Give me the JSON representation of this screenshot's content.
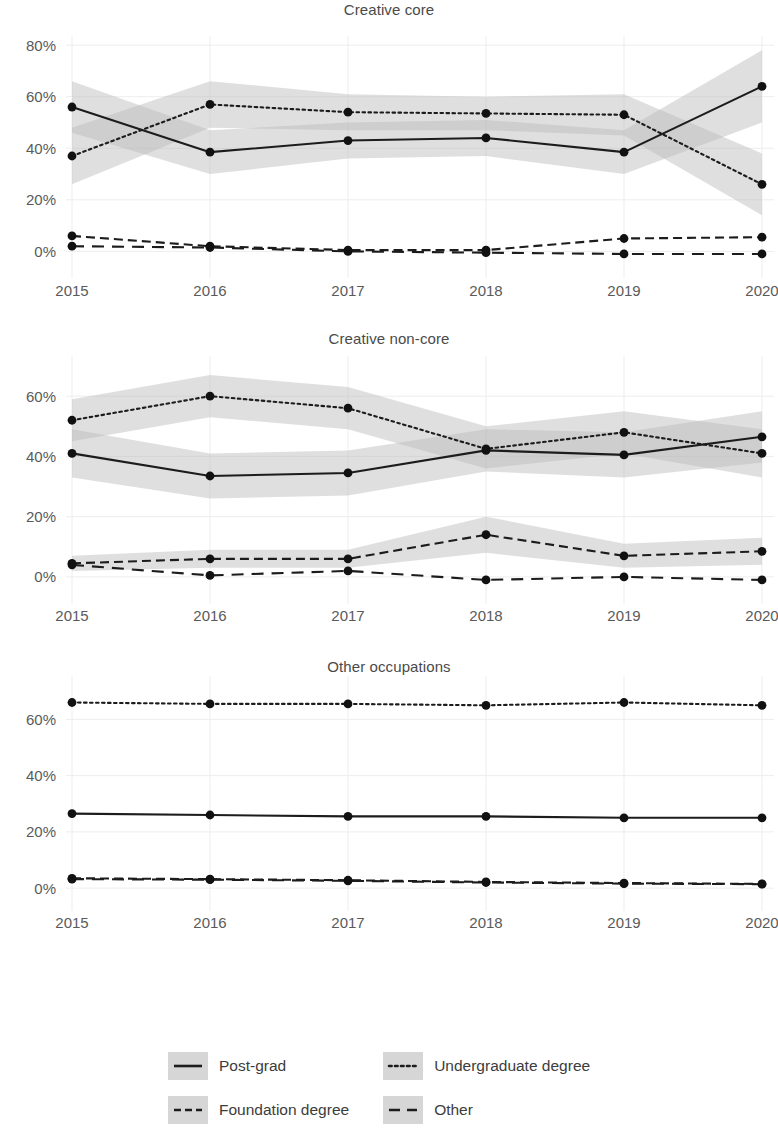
{
  "chart_data": {
    "type": "line",
    "title": "",
    "xlabel": "",
    "ylabel": "",
    "x": [
      2015,
      2016,
      2017,
      2018,
      2019,
      2020
    ],
    "xtick_labels": [
      "2015",
      "2016",
      "2017",
      "2018",
      "2019",
      "2020"
    ],
    "legend_position": "bottom",
    "grid": true,
    "value_format": "percent",
    "ribbon_description": "shaded 95% confidence interval band around each series",
    "panels": [
      {
        "title": "Creative core",
        "ylim": [
          -8,
          82
        ],
        "ytick_labels": [
          "0%",
          "20%",
          "40%",
          "60%",
          "80%"
        ],
        "yticks": [
          0,
          20,
          40,
          60,
          80
        ],
        "series": [
          {
            "name": "Post-grad",
            "style": "solid",
            "values": [
              56,
              38.5,
              43,
              44,
              38.5,
              64
            ],
            "lower": [
              46,
              30,
              36,
              37,
              30,
              50
            ],
            "upper": [
              66,
              47,
              50,
              51,
              47,
              78
            ]
          },
          {
            "name": "Undergraduate degree",
            "style": "dotted",
            "values": [
              37,
              57,
              54,
              53.5,
              53,
              26
            ],
            "lower": [
              26,
              48,
              47,
              47,
              45,
              14
            ],
            "upper": [
              48,
              66,
              61,
              60,
              61,
              38
            ]
          },
          {
            "name": "Foundation degree",
            "style": "dashdot",
            "values": [
              6,
              2,
              0.5,
              0.5,
              5,
              5.5
            ],
            "lower": [
              6,
              2,
              0.5,
              0.5,
              5,
              5.5
            ],
            "upper": [
              6,
              2,
              0.5,
              0.5,
              5,
              5.5
            ]
          },
          {
            "name": "Other",
            "style": "dashed",
            "values": [
              2,
              1.5,
              0,
              -0.5,
              -1,
              -1
            ],
            "lower": [
              2,
              1.5,
              0,
              -0.5,
              -1,
              -1
            ],
            "upper": [
              2,
              1.5,
              0,
              -0.5,
              -1,
              -1
            ]
          }
        ]
      },
      {
        "title": "Creative non-core",
        "ylim": [
          -7,
          72
        ],
        "ytick_labels": [
          "0%",
          "20%",
          "40%",
          "60%"
        ],
        "yticks": [
          0,
          20,
          40,
          60
        ],
        "series": [
          {
            "name": "Post-grad",
            "style": "solid",
            "values": [
              41,
              33.5,
              34.5,
              42,
              40.5,
              46.5
            ],
            "lower": [
              33,
              26,
              27,
              35,
              33,
              38
            ],
            "upper": [
              49,
              41,
              42,
              49,
              48,
              55
            ]
          },
          {
            "name": "Undergraduate degree",
            "style": "dotted",
            "values": [
              52,
              60,
              56,
              42.5,
              48,
              41
            ],
            "lower": [
              45,
              53,
              49,
              36,
              41,
              33
            ],
            "upper": [
              59,
              67,
              63,
              50,
              55,
              49
            ]
          },
          {
            "name": "Foundation degree",
            "style": "dashdot",
            "values": [
              4.5,
              6,
              6,
              14,
              7,
              8.5
            ],
            "lower": [
              2,
              3,
              3,
              8,
              3,
              4
            ],
            "upper": [
              7,
              9,
              9,
              20,
              11,
              13
            ]
          },
          {
            "name": "Other",
            "style": "dashed",
            "values": [
              4,
              0.5,
              2,
              -1,
              0,
              -1
            ],
            "lower": [
              4,
              0.5,
              2,
              -1,
              0,
              -1
            ],
            "upper": [
              4,
              0.5,
              2,
              -1,
              0,
              -1
            ]
          }
        ]
      },
      {
        "title": "Other occupations",
        "ylim": [
          -6,
          74
        ],
        "ytick_labels": [
          "0%",
          "20%",
          "40%",
          "60%"
        ],
        "yticks": [
          0,
          20,
          40,
          60
        ],
        "series": [
          {
            "name": "Post-grad",
            "style": "solid",
            "values": [
              26.5,
              26,
              25.5,
              25.5,
              25,
              25
            ],
            "lower": [
              26.5,
              26,
              25.5,
              25.5,
              25,
              25
            ],
            "upper": [
              26.5,
              26,
              25.5,
              25.5,
              25,
              25
            ]
          },
          {
            "name": "Undergraduate degree",
            "style": "dotted",
            "values": [
              66,
              65.5,
              65.5,
              65,
              66,
              65
            ],
            "lower": [
              66,
              65.5,
              65.5,
              65,
              66,
              65
            ],
            "upper": [
              66,
              65.5,
              65.5,
              65,
              66,
              65
            ]
          },
          {
            "name": "Foundation degree",
            "style": "dashdot",
            "values": [
              3.5,
              3.2,
              2.8,
              2.2,
              1.8,
              1.5
            ],
            "lower": [
              3.5,
              3.2,
              2.8,
              2.2,
              1.8,
              1.5
            ],
            "upper": [
              3.5,
              3.2,
              2.8,
              2.2,
              1.8,
              1.5
            ]
          },
          {
            "name": "Other",
            "style": "dashed",
            "values": [
              3.2,
              3.0,
              2.6,
              2.0,
              1.6,
              1.4
            ],
            "lower": [
              3.2,
              3.0,
              2.6,
              2.0,
              1.6,
              1.4
            ],
            "upper": [
              3.2,
              3.0,
              2.6,
              2.0,
              1.6,
              1.4
            ]
          }
        ]
      }
    ],
    "legend": [
      {
        "label": "Post-grad",
        "style": "solid"
      },
      {
        "label": "Undergraduate degree",
        "style": "dotted"
      },
      {
        "label": "Foundation degree",
        "style": "dashdot"
      },
      {
        "label": "Other",
        "style": "dashed"
      }
    ]
  }
}
